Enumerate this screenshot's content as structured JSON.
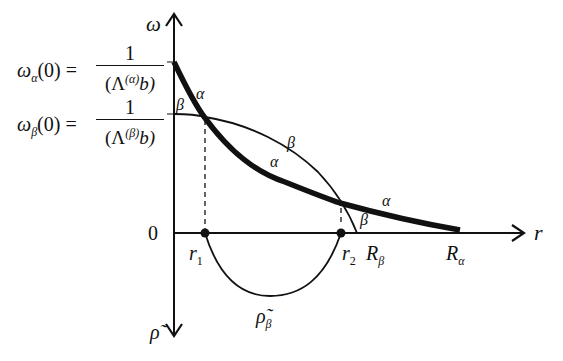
{
  "diagram": {
    "axes": {
      "y_label": "ω",
      "x_label": "r",
      "down_label": "ρ̃",
      "origin_label": "0"
    },
    "equations": {
      "omega_alpha": {
        "lhs": "ω",
        "lhs_sub": "α",
        "lhs_arg": "(0) =",
        "num": "1",
        "den_open": "(Λ",
        "den_sup": "(α)",
        "den_close": "b)"
      },
      "omega_beta": {
        "lhs": "ω",
        "lhs_sub": "β",
        "lhs_arg": "(0) =",
        "num": "1",
        "den_open": "(Λ",
        "den_sup": "(β)",
        "den_close": "b)"
      }
    },
    "curves": {
      "alpha": {
        "label": "α",
        "style": "thick",
        "labels": [
          "α",
          "α",
          "α"
        ]
      },
      "beta": {
        "label": "β",
        "style": "thin",
        "labels": [
          "β",
          "β",
          "β"
        ]
      },
      "rho_beta": {
        "label": "ρ̃",
        "sub": "β"
      }
    },
    "points": {
      "r1": {
        "label": "r",
        "sub": "1"
      },
      "r2": {
        "label": "r",
        "sub": "2"
      },
      "R_beta": {
        "label": "R",
        "sub": "β"
      },
      "R_alpha": {
        "label": "R",
        "sub": "α"
      }
    }
  }
}
